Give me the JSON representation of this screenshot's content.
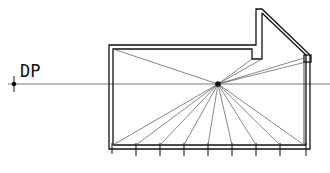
{
  "diagram": {
    "title_label": "DP",
    "colors": {
      "stroke": "#111111",
      "ray": "#555555",
      "horizon": "#666666"
    },
    "vanishing_point": {
      "x": 218,
      "y": 84
    },
    "station_point": {
      "x": 14,
      "y": 84
    },
    "horizon_y": 84,
    "floor_ticks_x": [
      112,
      136,
      160,
      184,
      208,
      232,
      256,
      280,
      306
    ],
    "rays_to_corners": [
      [
        112,
        48
      ],
      [
        257,
        55
      ],
      [
        306,
        55
      ]
    ]
  }
}
